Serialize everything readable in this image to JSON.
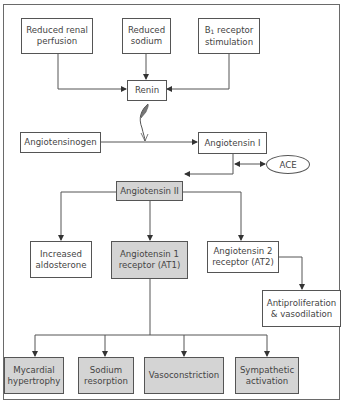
{
  "diagram": {
    "nodes": {
      "reduced_renal_perfusion": "Reduced renal\nperfusion",
      "reduced_sodium": "Reduced\nsodium",
      "b1_prefix": "B",
      "b1_sub": "1",
      "b1_rest": " receptor\nstimulation",
      "renin": "Renin",
      "angiotensinogen": "Angiotensinogen",
      "angiotensin_1": "Angiotensin I",
      "ace": "ACE",
      "angiotensin_2": "Angiotensin II",
      "increased_aldosterone": "Increased\naldosterone",
      "at1": "Angiotensin 1\nreceptor (AT1)",
      "at2": "Angiotensin 2\nreceptor (AT2)",
      "antiproliferation": "Antiproliferation\n& vasodilation",
      "myocardial_hypertrophy": "Mycardial\nhypertrophy",
      "sodium_resorption": "Sodium\nresorption",
      "vasoconstriction": "Vasoconstriction",
      "sympathetic_activation": "Sympathetic\nactivation"
    },
    "colors": {
      "shaded_box": "#d4d4d4",
      "line": "#555555"
    }
  }
}
